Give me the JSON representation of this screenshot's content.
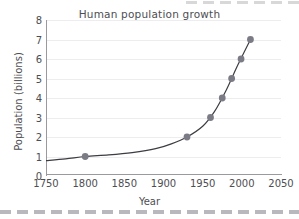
{
  "chart_data": {
    "type": "line",
    "title": "Human population growth",
    "xlabel": "Year",
    "ylabel": "Population (billions)",
    "xlim": [
      1750,
      2050
    ],
    "ylim": [
      0,
      8
    ],
    "xticks": [
      1750,
      1800,
      1850,
      1900,
      1950,
      2000,
      2050
    ],
    "yticks": [
      0,
      1,
      2,
      3,
      4,
      5,
      6,
      7,
      8
    ],
    "grid": "horizontal",
    "legend": "none",
    "marker_color": "#7b7b85",
    "line_color": "#3c3c42",
    "grid_color": "#ededf0",
    "axis_color": "#9a9a9e",
    "text_color": "#4e4e52",
    "series": [
      {
        "name": "Human population",
        "x": [
          1800,
          1930,
          1960,
          1975,
          1987,
          1999,
          2011
        ],
        "y": [
          1,
          2,
          3,
          4,
          5,
          6,
          7
        ]
      }
    ],
    "curve_x": [
      1750,
      1775,
      1800,
      1830,
      1860,
      1890,
      1910,
      1930,
      1950,
      1965,
      1980,
      1995,
      2011
    ],
    "curve_y": [
      0.79,
      0.88,
      1.0,
      1.08,
      1.2,
      1.4,
      1.65,
      2.0,
      2.55,
      3.3,
      4.4,
      5.7,
      7.0
    ]
  },
  "decoration": {
    "bottom_dash_color": "#b9b9bd",
    "top_dash_color": "#d8d8d8"
  }
}
